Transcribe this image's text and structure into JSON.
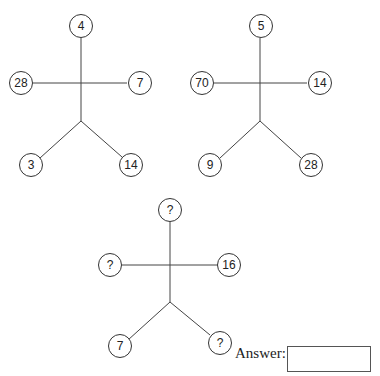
{
  "puzzle": {
    "figures": [
      {
        "top": "4",
        "left": "28",
        "right": "7",
        "bottom_left": "3",
        "bottom_right": "14"
      },
      {
        "top": "5",
        "left": "70",
        "right": "14",
        "bottom_left": "9",
        "bottom_right": "28"
      },
      {
        "top": "?",
        "left": "?",
        "right": "16",
        "bottom_left": "7",
        "bottom_right": "?"
      }
    ],
    "answer_label": "Answer:",
    "answer_value": ""
  }
}
